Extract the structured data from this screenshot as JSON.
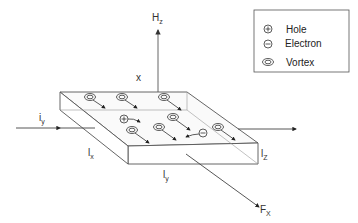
{
  "diagram": {
    "labels": {
      "field": "H",
      "field_sub": "z",
      "x_axis": "x",
      "current": "i",
      "current_sub": "y",
      "dim_x": "l",
      "dim_x_sub": "x",
      "dim_y": "l",
      "dim_y_sub": "y",
      "dim_z": "l",
      "dim_z_sub": "Z",
      "force": "F",
      "force_sub": "X"
    },
    "legend": {
      "items": [
        {
          "symbol": "plus-circle",
          "label": "Hole"
        },
        {
          "symbol": "minus-circle",
          "label": "Electron"
        },
        {
          "symbol": "double-ellipse",
          "label": "Vortex"
        }
      ]
    }
  }
}
